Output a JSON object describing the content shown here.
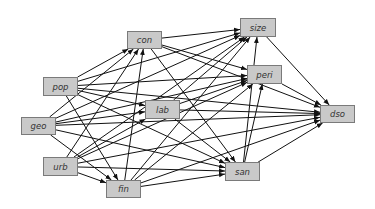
{
  "diagram": {
    "type": "directed-graph",
    "node_fill": "#c9c9c9",
    "node_border": "#7a7a7a",
    "edge_color": "#111111",
    "nodes": [
      {
        "id": "con",
        "label": "con",
        "x": 127,
        "y": 31,
        "w": 35,
        "h": 18
      },
      {
        "id": "size",
        "label": "size",
        "x": 240,
        "y": 18,
        "w": 36,
        "h": 19
      },
      {
        "id": "peri",
        "label": "peri",
        "x": 247,
        "y": 65,
        "w": 35,
        "h": 19
      },
      {
        "id": "pop",
        "label": "pop",
        "x": 43,
        "y": 77,
        "w": 35,
        "h": 19
      },
      {
        "id": "lab",
        "label": "lab",
        "x": 145,
        "y": 100,
        "w": 35,
        "h": 19
      },
      {
        "id": "dso",
        "label": "dso",
        "x": 320,
        "y": 105,
        "w": 35,
        "h": 18
      },
      {
        "id": "geo",
        "label": "geo",
        "x": 21,
        "y": 117,
        "w": 35,
        "h": 18
      },
      {
        "id": "urb",
        "label": "urb",
        "x": 43,
        "y": 157,
        "w": 35,
        "h": 19
      },
      {
        "id": "san",
        "label": "san",
        "x": 225,
        "y": 162,
        "w": 35,
        "h": 19
      },
      {
        "id": "fin",
        "label": "fin",
        "x": 106,
        "y": 180,
        "w": 35,
        "h": 18
      }
    ],
    "edges": [
      [
        "pop",
        "con"
      ],
      [
        "pop",
        "size"
      ],
      [
        "pop",
        "peri"
      ],
      [
        "pop",
        "lab"
      ],
      [
        "pop",
        "dso"
      ],
      [
        "pop",
        "san"
      ],
      [
        "pop",
        "fin"
      ],
      [
        "geo",
        "con"
      ],
      [
        "geo",
        "size"
      ],
      [
        "geo",
        "peri"
      ],
      [
        "geo",
        "lab"
      ],
      [
        "geo",
        "dso"
      ],
      [
        "geo",
        "san"
      ],
      [
        "geo",
        "fin"
      ],
      [
        "urb",
        "con"
      ],
      [
        "urb",
        "size"
      ],
      [
        "urb",
        "peri"
      ],
      [
        "urb",
        "lab"
      ],
      [
        "urb",
        "dso"
      ],
      [
        "urb",
        "san"
      ],
      [
        "urb",
        "fin"
      ],
      [
        "con",
        "size"
      ],
      [
        "con",
        "peri"
      ],
      [
        "con",
        "dso"
      ],
      [
        "con",
        "san"
      ],
      [
        "lab",
        "size"
      ],
      [
        "lab",
        "peri"
      ],
      [
        "lab",
        "dso"
      ],
      [
        "lab",
        "san"
      ],
      [
        "fin",
        "con"
      ],
      [
        "fin",
        "size"
      ],
      [
        "fin",
        "peri"
      ],
      [
        "fin",
        "dso"
      ],
      [
        "fin",
        "san"
      ],
      [
        "size",
        "dso"
      ],
      [
        "peri",
        "dso"
      ],
      [
        "san",
        "dso"
      ],
      [
        "san",
        "size"
      ],
      [
        "san",
        "peri"
      ]
    ]
  }
}
